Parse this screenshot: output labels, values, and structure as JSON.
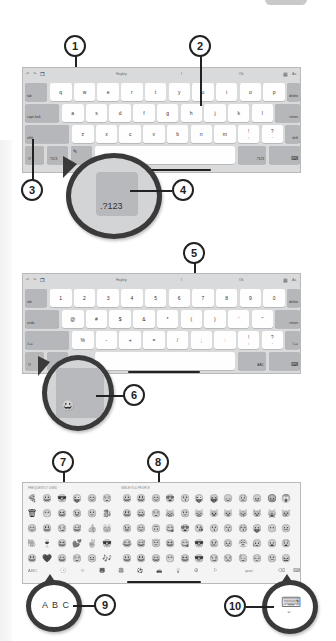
{
  "callouts": [
    "1",
    "2",
    "3",
    "4",
    "5",
    "6",
    "7",
    "8",
    "9",
    "10"
  ],
  "keyboard_letters": {
    "toolbar": {
      "undo_icon": "↶",
      "redo_icon": "↷",
      "clipboard_icon": "❐",
      "suggestions": [
        "Hayley",
        "I",
        "Ok"
      ],
      "keyboard_icon": "▦",
      "format_label": "Aa"
    },
    "row1": [
      "q",
      "w",
      "e",
      "r",
      "t",
      "y",
      "u",
      "i",
      "o",
      "p"
    ],
    "row2": [
      "a",
      "s",
      "d",
      "f",
      "g",
      "h",
      "j",
      "k",
      "l"
    ],
    "row3": [
      "z",
      "x",
      "c",
      "v",
      "b",
      "n",
      "m"
    ],
    "row3_punct": [
      {
        "top": "!",
        "bottom": ","
      },
      {
        "top": "?",
        "bottom": "."
      }
    ],
    "tab": "tab",
    "delete": "delete",
    "caps_lock": "caps lock",
    "return": "return",
    "shift_left": "shift",
    "shift_right": "shift",
    "emoji_icon": "☺",
    "numbers_left": ".?123",
    "dictation_icon": "✎",
    "numbers_right": ".?123",
    "hide_keyboard_icon": "⌨"
  },
  "magnifier_numbers": {
    "label": ".?123"
  },
  "keyboard_numbers": {
    "toolbar": {
      "undo_icon": "↶",
      "redo_icon": "↷",
      "clipboard_icon": "❐",
      "suggestions": [
        "Hayley",
        "I",
        "Ok"
      ],
      "keyboard_icon": "▦",
      "format_label": "Aa"
    },
    "row1": [
      "1",
      "2",
      "3",
      "4",
      "5",
      "6",
      "7",
      "8",
      "9",
      "0"
    ],
    "row2": [
      "@",
      "#",
      "$",
      "&",
      "*",
      "(",
      ")",
      "'",
      "\""
    ],
    "row3": [
      "%",
      "-",
      "+",
      "=",
      "/",
      ";",
      ":"
    ],
    "row3_punct": [
      {
        "top": "!",
        "bottom": ","
      },
      {
        "top": "?",
        "bottom": "."
      }
    ],
    "tab": "tab",
    "delete": "delete",
    "undo": "undo",
    "return": "return",
    "symbols_left": "#+=",
    "symbols_right": "#+=",
    "emoji_icon": "☺",
    "abc_label": "ABC",
    "hide_keyboard_icon": "⌨"
  },
  "magnifier_emoji": {
    "icon": "😀"
  },
  "keyboard_emoji": {
    "sections": [
      "FREQUENTLY USED",
      "SMILEYS & PEOPLE"
    ],
    "frequently_used": [
      "🍕",
      "😀",
      "😎",
      "😜",
      "😊",
      "😌",
      "🗑",
      "😁",
      "😆",
      "😉",
      "🙂",
      "🐉",
      "😊",
      "😃",
      "😏",
      "😅",
      "👍",
      "👑",
      "🐘",
      "🍷",
      "😆",
      "💕",
      "✌",
      "😎",
      "😃",
      "🖤",
      "😄",
      "😌",
      "😐",
      "🎶"
    ],
    "smileys_people": [
      "😀",
      "😃",
      "😊",
      "😍",
      "😗",
      "😜",
      "😝",
      "😞",
      "😟",
      "😠",
      "😡",
      "😱",
      "😃",
      "😄",
      "😌",
      "😹",
      "🙂",
      "😸",
      "😺",
      "😼",
      "😽",
      "😾",
      "🙀",
      "😿",
      "😉",
      "😊",
      "🙃",
      "😋",
      "😍",
      "😘",
      "😗",
      "😙",
      "😚",
      "😛",
      "😶",
      "😐",
      "😂",
      "😅",
      "😇",
      "😆",
      "😋",
      "😎",
      "😢",
      "😣",
      "😤",
      "😥",
      "😦",
      "😧",
      "😀",
      "😃",
      "😄",
      "😁",
      "😆",
      "😎",
      "😏",
      "😒",
      "😓",
      "😔",
      "😕",
      "😖"
    ],
    "categories": [
      "ABC",
      "🕒",
      "☺",
      "🐻",
      "🍔",
      "⚽",
      "🚗",
      "💡",
      "☮",
      "⚐",
      "space",
      "⌫",
      "⌨"
    ]
  },
  "magnifier_abc": {
    "label": "A B C"
  },
  "magnifier_keyboard": {
    "icon": "⌨",
    "chevron": "⌄"
  }
}
